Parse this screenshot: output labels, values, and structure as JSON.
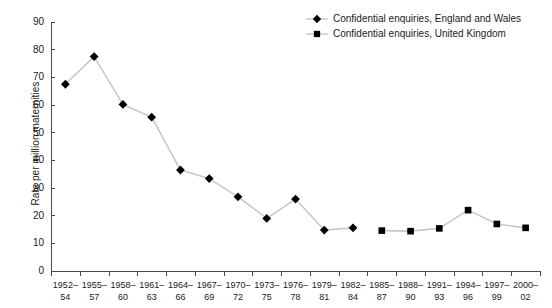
{
  "chart_data": {
    "type": "line",
    "title": "",
    "xlabel": "",
    "ylabel": "Rate per million maternities",
    "ylim": [
      0,
      90
    ],
    "yticks": [
      0,
      10,
      20,
      30,
      40,
      50,
      60,
      70,
      80,
      90
    ],
    "grid": false,
    "legend_position": "top-right",
    "categories": [
      "1952-54",
      "1955-57",
      "1958-60",
      "1961-63",
      "1964-66",
      "1967-69",
      "1970-72",
      "1973-75",
      "1976-78",
      "1979-81",
      "1982-84",
      "1985-87",
      "1988-90",
      "1991-93",
      "1994-96",
      "1997-99",
      "2000-02"
    ],
    "category_lines": [
      [
        "1952–",
        "54"
      ],
      [
        "1955–",
        "57"
      ],
      [
        "1958–",
        "60"
      ],
      [
        "1961–",
        "63"
      ],
      [
        "1964–",
        "66"
      ],
      [
        "1967–",
        "69"
      ],
      [
        "1970–",
        "72"
      ],
      [
        "1973–",
        "75"
      ],
      [
        "1976–",
        "78"
      ],
      [
        "1979–",
        "81"
      ],
      [
        "1982–",
        "84"
      ],
      [
        "1985–",
        "87"
      ],
      [
        "1988–",
        "90"
      ],
      [
        "1991–",
        "93"
      ],
      [
        "1994–",
        "96"
      ],
      [
        "1997–",
        "99"
      ],
      [
        "2000–",
        "02"
      ]
    ],
    "series": [
      {
        "name": "Confidential enquiries, England and Wales",
        "marker": "diamond",
        "color": "#000000",
        "line_color": "#c8c8c8",
        "values": [
          67.5,
          77.5,
          60.2,
          55.6,
          36.5,
          33.4,
          26.8,
          19.0,
          26.0,
          14.8,
          15.6,
          null,
          null,
          null,
          null,
          null,
          null
        ]
      },
      {
        "name": "Confidential enquiries, United Kingdom",
        "marker": "square",
        "color": "#000000",
        "line_color": "#c8c8c8",
        "values": [
          null,
          null,
          null,
          null,
          null,
          null,
          null,
          null,
          null,
          null,
          null,
          14.6,
          14.4,
          15.4,
          22.0,
          17.0,
          15.6
        ]
      }
    ]
  },
  "legend": {
    "items": [
      {
        "label": "Confidential enquiries, England and Wales",
        "marker": "diamond"
      },
      {
        "label": "Confidential enquiries, United Kingdom",
        "marker": "square"
      }
    ]
  },
  "axes": {
    "y_title": "Rate per million maternities"
  }
}
